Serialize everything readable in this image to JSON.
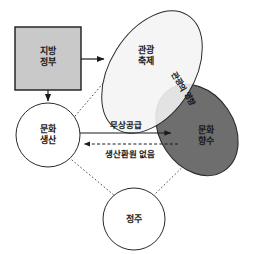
{
  "diagram": {
    "title": "",
    "background_color": "#ffffff",
    "stroke_color": "#1a1a1a",
    "nodes": {
      "local_government": {
        "label_line1": "지방",
        "label_line2": "정부",
        "shape": "rectangle",
        "fill": "#c9c9c9"
      },
      "tourism_festival": {
        "label_line1": "관광",
        "label_line2": "축제",
        "shape": "ellipse",
        "fill": "#f4f4f4"
      },
      "cultural_consumption": {
        "label_line1": "문화",
        "label_line2": "향수",
        "shape": "ellipse",
        "fill": "#6e6e6e"
      },
      "cultural_production": {
        "label_line1": "문화",
        "label_line2": "생산",
        "shape": "circle",
        "fill": "#ffffff"
      },
      "settlement": {
        "label_line1": "정주",
        "label_line2": "",
        "shape": "circle",
        "fill": "#ffffff"
      }
    },
    "overlap_label": "관광의 영향",
    "edges": {
      "free_supply": {
        "label": "무상공급",
        "style": "solid",
        "from": "cultural_production",
        "to": "cultural_consumption"
      },
      "no_return": {
        "label": "생산환원 없음",
        "style": "dashed",
        "from": "cultural_consumption",
        "to": "cultural_production"
      },
      "gov_to_festival": {
        "label": "",
        "style": "solid",
        "from": "local_government",
        "to": "tourism_festival"
      },
      "gov_to_production": {
        "label": "",
        "style": "solid",
        "from": "local_government",
        "to": "cultural_production"
      },
      "production_to_festival": {
        "label": "",
        "style": "dotted",
        "from": "cultural_production",
        "to": "tourism_festival"
      },
      "settlement_to_production": {
        "label": "",
        "style": "dotted",
        "from": "settlement",
        "to": "cultural_production"
      },
      "settlement_to_consumption": {
        "label": "",
        "style": "dotted",
        "from": "settlement",
        "to": "cultural_consumption"
      }
    }
  }
}
